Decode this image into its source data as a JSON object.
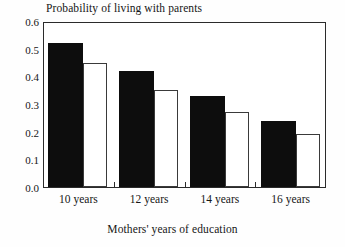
{
  "chart_data": {
    "type": "bar",
    "title": "Probability of living with parents",
    "xlabel": "Mothers' years of education",
    "ylabel": "",
    "categories": [
      "10 years",
      "12 years",
      "14 years",
      "16 years"
    ],
    "series": [
      {
        "name": "solid",
        "style": "filled-black",
        "values": [
          0.52,
          0.42,
          0.33,
          0.24
        ]
      },
      {
        "name": "hollow",
        "style": "white-outlined",
        "values": [
          0.45,
          0.35,
          0.27,
          0.19
        ]
      }
    ],
    "ylim": [
      0.0,
      0.6
    ],
    "ytick_values": [
      0.0,
      0.1,
      0.2,
      0.3,
      0.4,
      0.5,
      0.6
    ],
    "ytick_labels": [
      "0.0",
      "0.1",
      "0.2",
      "0.3",
      "0.4",
      "0.5",
      "0.6"
    ],
    "grid": false,
    "legend": "none",
    "colors": {
      "series_solid": "#0d0d0d",
      "series_hollow": "#ffffff",
      "outline": "#3a3a3a",
      "axis": "#2b2b2b",
      "text": "#161616",
      "background": "#fefefe"
    }
  }
}
